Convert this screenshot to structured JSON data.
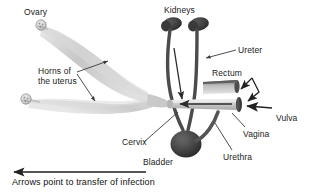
{
  "figure": {
    "background_color": "#ffffff"
  },
  "labels": {
    "ovary": "Ovary",
    "kidneys": "Kidneys",
    "ureter": "Ureter",
    "rectum": "Rectum",
    "vulva": "Vulva",
    "vagina": "Vagina",
    "urethra": "Urethra",
    "bladder": "Bladder",
    "cervix": "Cervix",
    "horns_line1": "Horns of",
    "horns_line2": "the uterus"
  },
  "caption": {
    "text": "Arrows point to transfer of infection"
  },
  "colors": {
    "text": "#1a1a1a",
    "leader_line": "#3a3a3a",
    "arrow": "#2b2b2b",
    "kidney_dark": "#3c3c3c",
    "bladder_dark": "#3a3a3a",
    "ureter_tube": "#4a4a4a",
    "uterus_light": "#cfcfcf",
    "vagina_light": "#d8d8d8",
    "rectum_mid": "#8c8c8c"
  },
  "anatomy_parts": [
    "ovary-left-upper",
    "ovary-left-lower",
    "uterine-horn-upper",
    "uterine-horn-lower",
    "kidney-left",
    "kidney-right",
    "ureter-left",
    "ureter-right",
    "bladder",
    "urethra",
    "cervix",
    "vagina",
    "vulva",
    "rectum"
  ],
  "infection_arrows": [
    "arrow-vagina-to-cervix",
    "arrow-ureter-descending",
    "arrow-rectum-to-vagina",
    "arrow-rectum-to-vulva",
    "arrow-external-to-vulva",
    "arrow-caption-direction"
  ]
}
